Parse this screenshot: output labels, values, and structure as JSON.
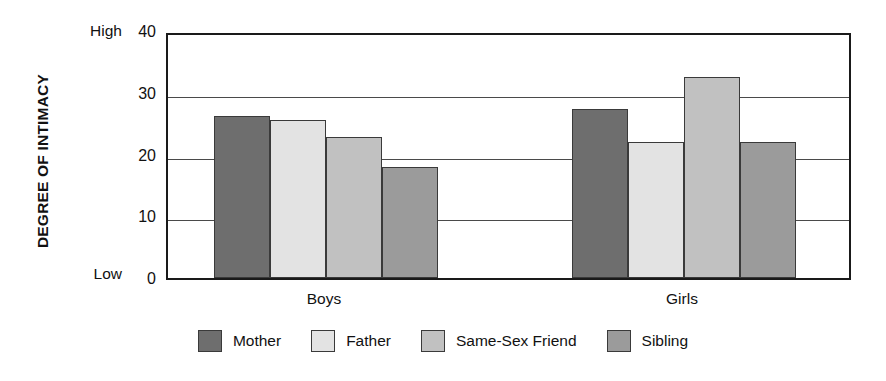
{
  "chart_data": {
    "type": "bar",
    "title": "",
    "xlabel": "",
    "ylabel": "DEGREE OF INTIMACY",
    "ylim": [
      0,
      40
    ],
    "ytick_values": [
      0,
      10,
      20,
      30,
      40
    ],
    "ytick_labels": [
      "0",
      "10",
      "20",
      "30",
      "40"
    ],
    "y_axis_endpoint_high": "High",
    "y_axis_endpoint_low": "Low",
    "grid": true,
    "grid_axis": "y",
    "legend_position": "bottom",
    "categories": [
      "Boys",
      "Girls"
    ],
    "series": [
      {
        "name": "Mother",
        "color": "#6e6e6e",
        "values": [
          26.3,
          27.3
        ]
      },
      {
        "name": "Father",
        "color": "#e3e3e3",
        "values": [
          25.6,
          22.1
        ]
      },
      {
        "name": "Same-Sex Friend",
        "color": "#c1c1c1",
        "values": [
          22.8,
          32.5
        ]
      },
      {
        "name": "Sibling",
        "color": "#9b9b9b",
        "values": [
          18.0,
          22.0
        ]
      }
    ]
  }
}
